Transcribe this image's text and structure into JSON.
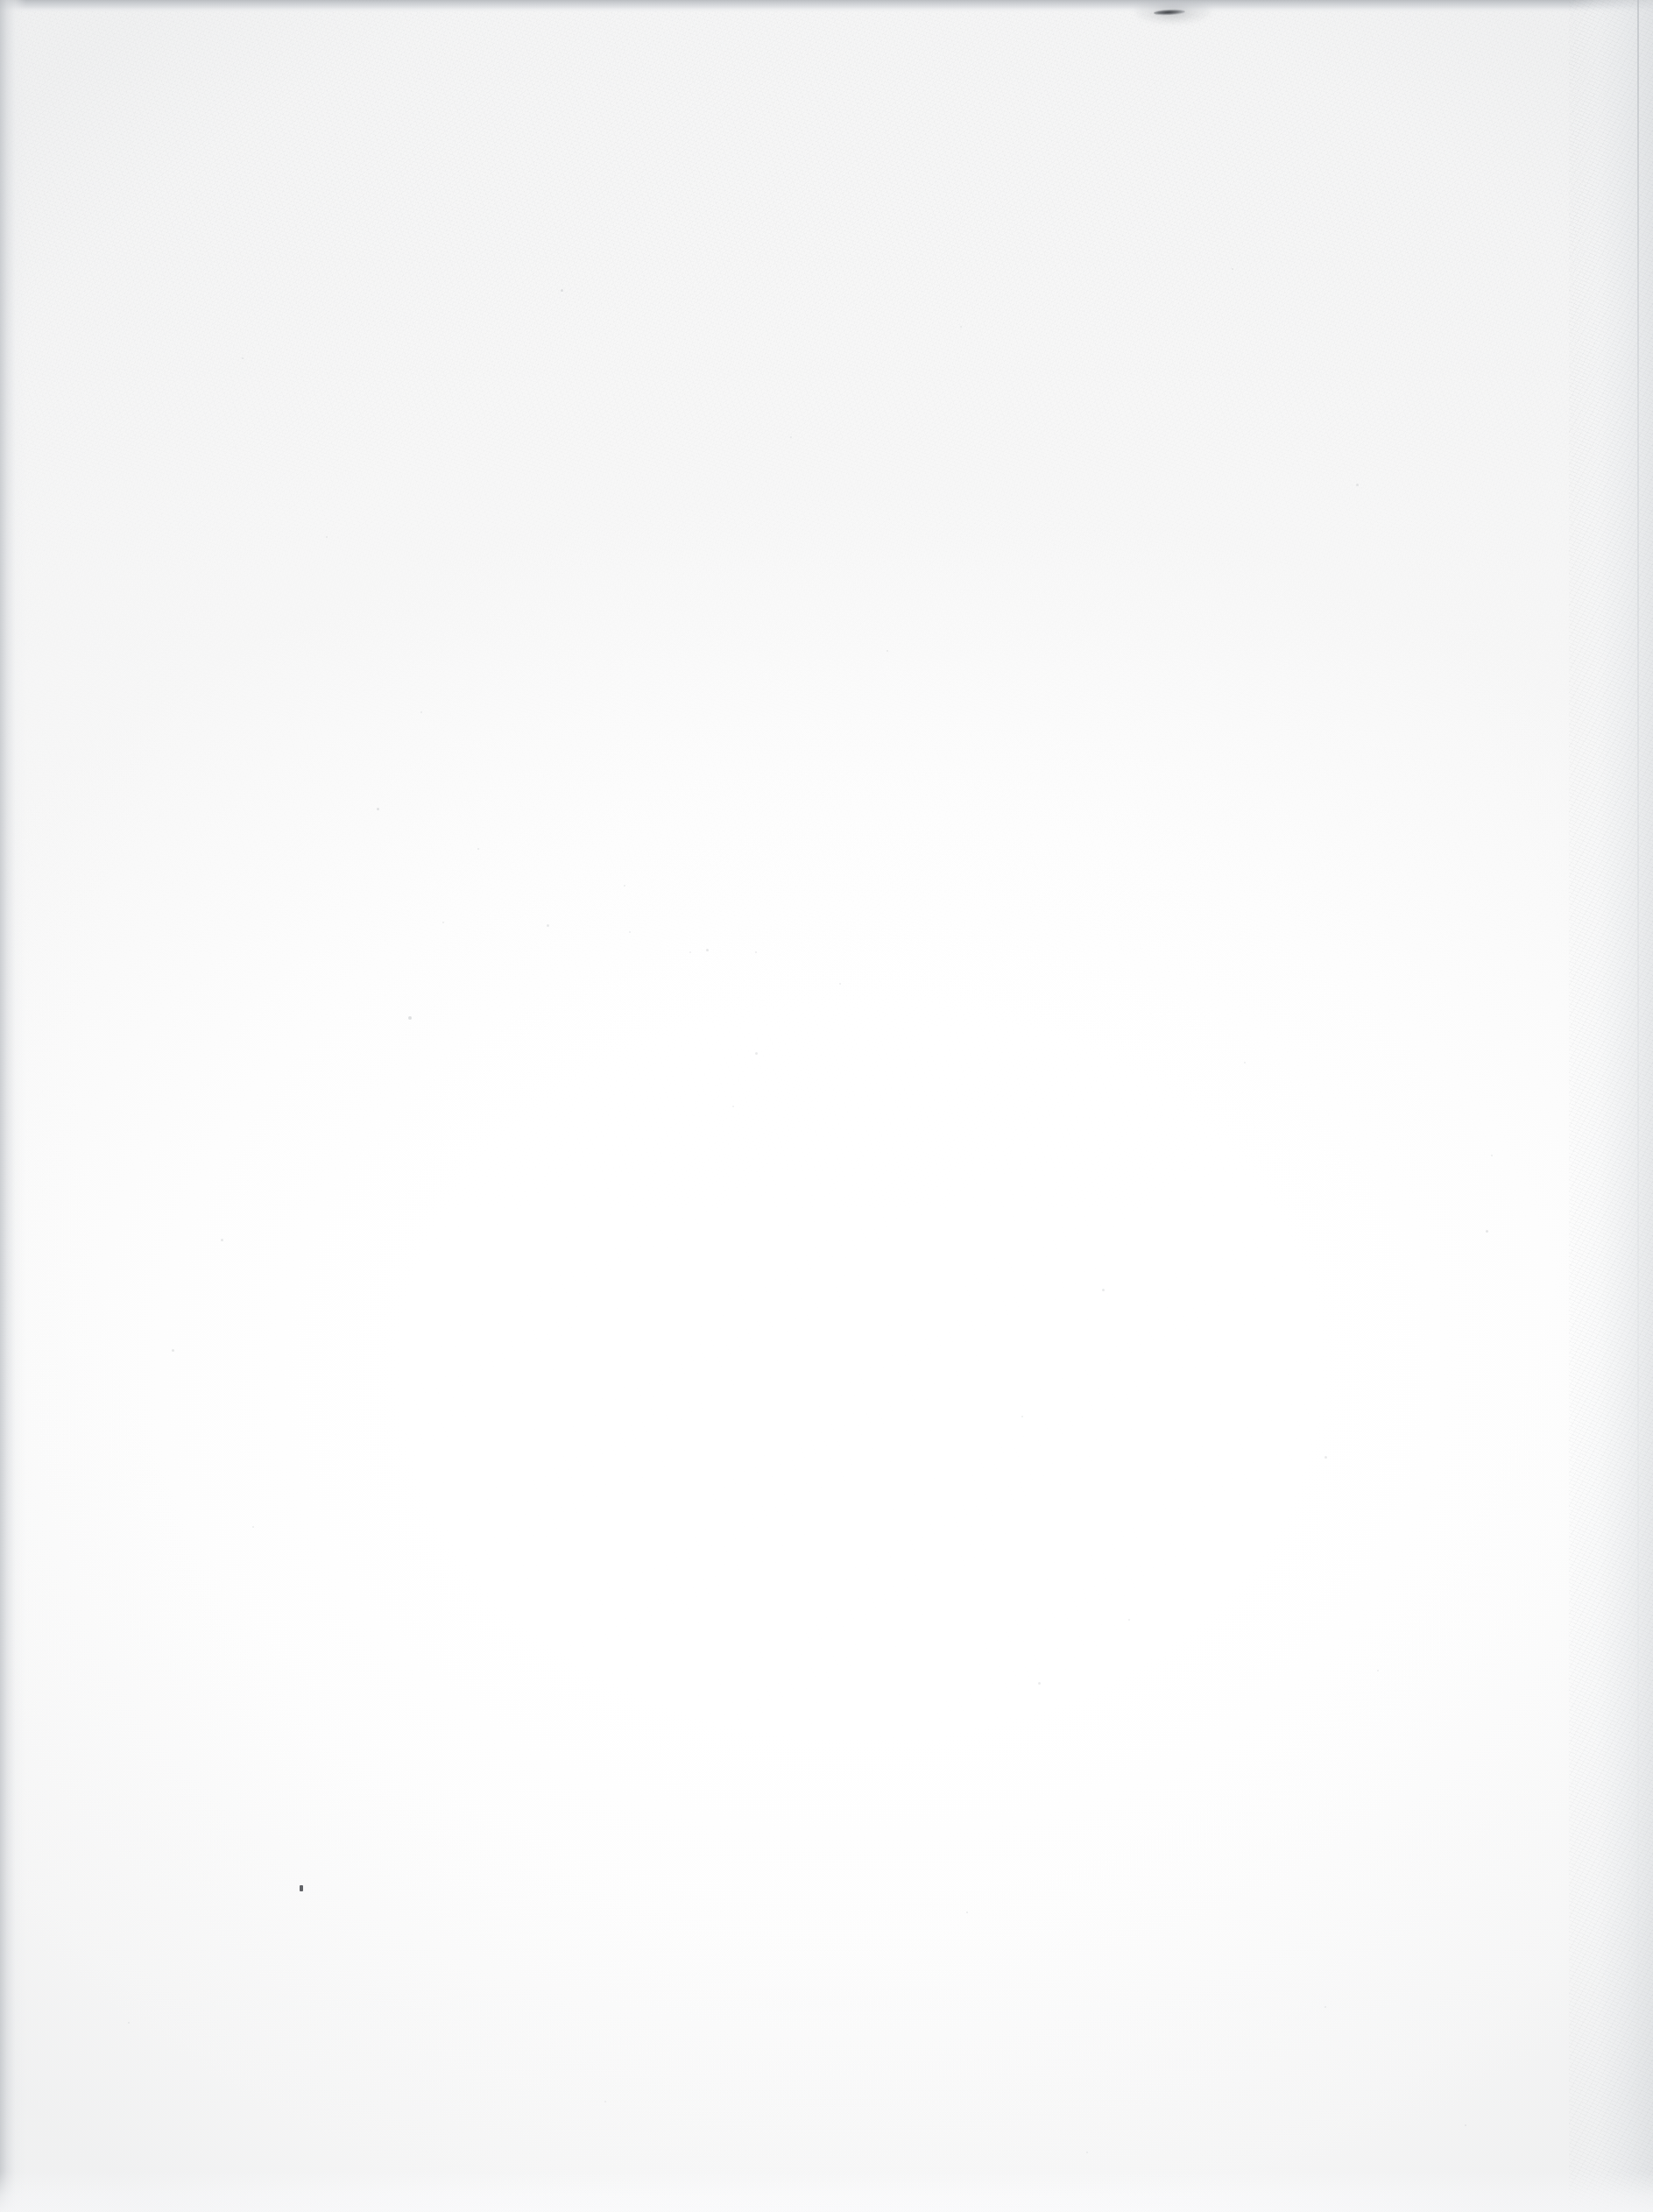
{
  "page": {
    "kind": "scanned-document-page",
    "content_state": "blank",
    "visible_text": "",
    "width_px": 1887,
    "height_px": 2525
  },
  "colors": {
    "paper_center": "#ffffff",
    "paper_body": "#fdfdfd",
    "paper_grain_upper": "#f4f5f6",
    "scan_edge_top": "#b9bcc0",
    "scan_edge_left": "#c4c7cb",
    "scan_edge_right": "#e2e4e6",
    "crease_line": "#b0b4b9",
    "ink_smudge": "#282a2e",
    "speck": "#373a3e"
  },
  "regions": [
    {
      "name": "top-scan-edge",
      "description": "Dark grey scanner edge band across the top of the page",
      "x": 0,
      "y": 0,
      "width": 1887,
      "height": 14,
      "color": "#b9bcc0"
    },
    {
      "name": "left-scan-edge",
      "description": "Soft grey gradient band along the left margin",
      "x": 0,
      "y": 0,
      "width": 30,
      "height": 2525,
      "color": "#c4c7cb"
    },
    {
      "name": "right-scan-edge",
      "description": "Textured light grey band along the right margin",
      "x": 1791,
      "y": 0,
      "width": 96,
      "height": 2525,
      "color": "#e2e4e6"
    },
    {
      "name": "right-crease-line",
      "description": "Faint vertical crease line near the right margin",
      "x": 1869,
      "y": 0,
      "width": 2,
      "height": 2525,
      "color": "#b0b4b9"
    },
    {
      "name": "bottom-light-band",
      "description": "Slightly brighter band along the bottom edge",
      "x": 0,
      "y": 2479,
      "width": 1887,
      "height": 46,
      "color": "#fcfcfd"
    },
    {
      "name": "upper-grain-field",
      "description": "Paper fibre texture most visible in the upper third",
      "x": 0,
      "y": 10,
      "width": 1887,
      "height": 650,
      "color": "#f4f5f6"
    }
  ],
  "artefacts": [
    {
      "name": "ink-smudge",
      "description": "Small dark horizontal ink streak at the top edge",
      "x": 1317,
      "y": 11,
      "width": 36,
      "height": 6,
      "color": "#282a2e"
    },
    {
      "name": "speck-lower-left",
      "description": "Tiny isolated dark speck in the lower-left area",
      "x": 342,
      "y": 2152,
      "width": 4,
      "height": 7,
      "color": "#373a3e"
    }
  ],
  "specks": [
    {
      "x": 430,
      "y": 922,
      "size": 3,
      "opacity": 0.26
    },
    {
      "x": 545,
      "y": 968,
      "size": 2,
      "opacity": 0.2
    },
    {
      "x": 712,
      "y": 1010,
      "size": 2,
      "opacity": 0.18
    },
    {
      "x": 624,
      "y": 1055,
      "size": 3,
      "opacity": 0.22
    },
    {
      "x": 505,
      "y": 1052,
      "size": 2,
      "opacity": 0.18
    },
    {
      "x": 718,
      "y": 1063,
      "size": 2,
      "opacity": 0.17
    },
    {
      "x": 806,
      "y": 1083,
      "size": 3,
      "opacity": 0.24
    },
    {
      "x": 862,
      "y": 1086,
      "size": 2,
      "opacity": 0.19
    },
    {
      "x": 787,
      "y": 1086,
      "size": 2,
      "opacity": 0.16
    },
    {
      "x": 466,
      "y": 1160,
      "size": 4,
      "opacity": 0.3
    },
    {
      "x": 958,
      "y": 1122,
      "size": 2,
      "opacity": 0.17
    },
    {
      "x": 862,
      "y": 1201,
      "size": 3,
      "opacity": 0.21
    },
    {
      "x": 252,
      "y": 1414,
      "size": 3,
      "opacity": 0.22
    },
    {
      "x": 836,
      "y": 1262,
      "size": 2,
      "opacity": 0.16
    },
    {
      "x": 1258,
      "y": 1471,
      "size": 3,
      "opacity": 0.22
    },
    {
      "x": 1166,
      "y": 1616,
      "size": 2,
      "opacity": 0.18
    },
    {
      "x": 1512,
      "y": 1662,
      "size": 3,
      "opacity": 0.21
    },
    {
      "x": 1288,
      "y": 1848,
      "size": 2,
      "opacity": 0.17
    },
    {
      "x": 1572,
      "y": 1906,
      "size": 2,
      "opacity": 0.16
    },
    {
      "x": 1185,
      "y": 1920,
      "size": 3,
      "opacity": 0.2
    },
    {
      "x": 1696,
      "y": 1404,
      "size": 3,
      "opacity": 0.24
    },
    {
      "x": 1702,
      "y": 1318,
      "size": 2,
      "opacity": 0.18
    },
    {
      "x": 1420,
      "y": 1212,
      "size": 2,
      "opacity": 0.17
    },
    {
      "x": 1103,
      "y": 2182,
      "size": 2,
      "opacity": 0.2
    },
    {
      "x": 1512,
      "y": 2290,
      "size": 2,
      "opacity": 0.17
    },
    {
      "x": 196,
      "y": 1540,
      "size": 3,
      "opacity": 0.23
    },
    {
      "x": 288,
      "y": 1742,
      "size": 2,
      "opacity": 0.18
    },
    {
      "x": 146,
      "y": 2308,
      "size": 2,
      "opacity": 0.17
    },
    {
      "x": 690,
      "y": 2398,
      "size": 2,
      "opacity": 0.16
    },
    {
      "x": 1672,
      "y": 2425,
      "size": 2,
      "opacity": 0.19
    },
    {
      "x": 1240,
      "y": 2456,
      "size": 2,
      "opacity": 0.17
    },
    {
      "x": 640,
      "y": 330,
      "size": 3,
      "opacity": 0.24
    },
    {
      "x": 276,
      "y": 408,
      "size": 2,
      "opacity": 0.2
    },
    {
      "x": 1096,
      "y": 372,
      "size": 2,
      "opacity": 0.18
    },
    {
      "x": 1406,
      "y": 306,
      "size": 2,
      "opacity": 0.19
    },
    {
      "x": 1548,
      "y": 552,
      "size": 3,
      "opacity": 0.22
    },
    {
      "x": 372,
      "y": 612,
      "size": 2,
      "opacity": 0.18
    },
    {
      "x": 902,
      "y": 498,
      "size": 2,
      "opacity": 0.17
    },
    {
      "x": 1012,
      "y": 742,
      "size": 2,
      "opacity": 0.18
    },
    {
      "x": 480,
      "y": 812,
      "size": 2,
      "opacity": 0.17
    }
  ]
}
